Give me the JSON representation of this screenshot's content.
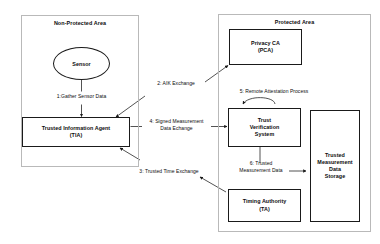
{
  "diagram": {
    "zones": [
      {
        "id": "non-protected-area",
        "label": "Non-Protected Area"
      },
      {
        "id": "protected-area",
        "label": "Protected Area"
      }
    ],
    "nodes": [
      {
        "id": "sensor",
        "label": "Sensor",
        "shape": "ellipse",
        "zone": "non-protected-area"
      },
      {
        "id": "trusted-information-agent",
        "line1": "Trusted Information Agent",
        "line2": "(TIA)",
        "shape": "rect",
        "zone": "non-protected-area"
      },
      {
        "id": "privacy-ca",
        "line1": "Privacy CA",
        "line2": "(PCA)",
        "shape": "rect",
        "zone": "protected-area"
      },
      {
        "id": "trust-verification-system",
        "line1": "Trust",
        "line2": "Verification",
        "line3": "System",
        "shape": "rect",
        "zone": "protected-area"
      },
      {
        "id": "timing-authority",
        "line1": "Timing Authority",
        "line2": "(TA)",
        "shape": "rect",
        "zone": "protected-area"
      },
      {
        "id": "trusted-measurement-data-storage",
        "line1": "Trusted",
        "line2": "Measurement",
        "line3": "Data",
        "line4": "Storage",
        "shape": "rect",
        "zone": "protected-area"
      }
    ],
    "edges": [
      {
        "id": "gather-sensor-data",
        "label": "1:Gather Sensor Data",
        "from": "sensor",
        "to": "trusted-information-agent"
      },
      {
        "id": "aik-exchange",
        "label": "2: AIK Exchange",
        "from": "trusted-information-agent",
        "to": "privacy-ca"
      },
      {
        "id": "trusted-time-exchange",
        "label": "3: Trusted Time Exchange",
        "from": "timing-authority",
        "to": "trusted-information-agent"
      },
      {
        "id": "signed-measurement-data-exchange",
        "line1": "4: Signed Measurement",
        "line2": "Data Echange",
        "from": "trusted-information-agent",
        "to": "trust-verification-system"
      },
      {
        "id": "remote-attestation-process",
        "label": "5: Remote Attestation Process",
        "from": "trust-verification-system",
        "to": "trust-verification-system"
      },
      {
        "id": "trusted-measurement-data",
        "line1": "6: Trusted",
        "line2": "Measurement Data",
        "from": "trust-verification-system",
        "to": "trusted-measurement-data-storage"
      }
    ],
    "colors": {
      "stroke": "#1a1a1a",
      "zone_stroke": "#b9b9b9",
      "text": "#0c0c0c",
      "background": "#ffffff"
    }
  }
}
